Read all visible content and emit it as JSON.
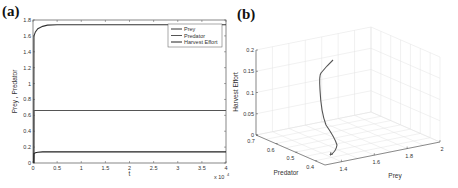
{
  "panels": {
    "a": {
      "label": "(a)"
    },
    "b": {
      "label": "(b)"
    }
  },
  "chart_data": [
    {
      "id": "a",
      "type": "line",
      "title": "",
      "xlabel": "t",
      "ylabel": "Prey , Predator",
      "x_multiplier": "x 10^4",
      "x_multiplier_base": "x 10",
      "x_multiplier_exp": "4",
      "xlim": [
        0,
        4
      ],
      "ylim": [
        0,
        1.8
      ],
      "xticks": [
        "0",
        "0.5",
        "1",
        "1.5",
        "2",
        "2.5",
        "3",
        "3.5",
        "4"
      ],
      "yticks": [
        "0",
        "0.2",
        "0.4",
        "0.6",
        "0.8",
        "1",
        "1.2",
        "1.4",
        "1.6",
        "1.8"
      ],
      "legend_position": "top-right",
      "grid": false,
      "x": [
        0,
        0.02,
        0.05,
        0.1,
        0.2,
        0.3,
        0.5,
        1,
        2,
        3,
        4
      ],
      "series": [
        {
          "name": "Prey",
          "values": [
            0,
            1.6,
            1.65,
            1.69,
            1.72,
            1.735,
            1.74,
            1.74,
            1.74,
            1.74,
            1.74
          ]
        },
        {
          "name": "Predator",
          "values": [
            0,
            0.66,
            0.66,
            0.66,
            0.66,
            0.66,
            0.66,
            0.66,
            0.66,
            0.66,
            0.66
          ]
        },
        {
          "name": "Harvest Effort",
          "values": [
            0,
            0.12,
            0.13,
            0.135,
            0.14,
            0.14,
            0.14,
            0.14,
            0.14,
            0.14,
            0.14
          ]
        }
      ]
    },
    {
      "id": "b",
      "type": "line3d",
      "title": "",
      "xlabel": "Prey",
      "ylabel": "Predator",
      "zlabel": "Harvest Effort",
      "xticks": [
        "1.4",
        "1.6",
        "1.8",
        "2"
      ],
      "yticks": [
        "0.4",
        "0.5",
        "0.6",
        "0.7"
      ],
      "zticks": [
        "0",
        "0.05",
        "0.1",
        "0.15",
        "0.2"
      ],
      "xlim": [
        1.3,
        2
      ],
      "ylim": [
        0.35,
        0.7
      ],
      "zlim": [
        0,
        0.2
      ],
      "grid": true,
      "trajectory": {
        "prey": [
          1.74,
          1.72,
          1.68,
          1.62,
          1.55,
          1.5
        ],
        "predator": [
          0.66,
          0.62,
          0.55,
          0.48,
          0.42,
          0.4
        ],
        "harvest": [
          0.14,
          0.12,
          0.09,
          0.06,
          0.03,
          0.0
        ]
      }
    }
  ]
}
